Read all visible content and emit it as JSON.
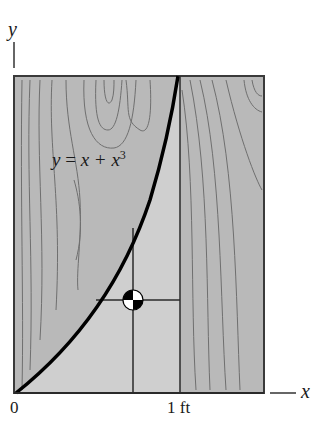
{
  "figure": {
    "axis_y_label": "y",
    "axis_x_label": "x",
    "equation": {
      "lhs": "y",
      "eq": "=",
      "rhs": "x + x",
      "exp": "3"
    },
    "tick_origin": "0",
    "tick_one": "1 ft",
    "colors": {
      "board_fill": "#b9b9b9",
      "region_fill": "#cfcfcf",
      "grain": "#6f6f6f",
      "curve": "#000000",
      "border": "#3a3a3a"
    }
  }
}
